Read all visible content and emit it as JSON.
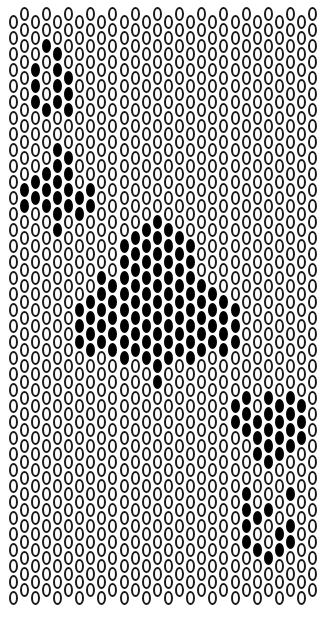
{
  "pattern": {
    "title": "Ace of Clubs peyote bead pattern",
    "colors": {
      "empty_fill": "#ffffff",
      "outline": "#1a1a1a",
      "filled": "#000000"
    },
    "grid": {
      "columns": 28,
      "rows": 37,
      "col_pitch": 11.1,
      "row_pitch": 16,
      "x0": 8.5,
      "even_col_top": 15,
      "odd_col_top": 7,
      "bottom_limit": 612
    },
    "filled_cells": {
      "top_left_A": [
        [
          2,
          3
        ],
        [
          2,
          4
        ],
        [
          2,
          5
        ],
        [
          3,
          2
        ],
        [
          3,
          6
        ],
        [
          4,
          2
        ],
        [
          4,
          3
        ],
        [
          4,
          4
        ],
        [
          4,
          5
        ],
        [
          5,
          4
        ],
        [
          5,
          5
        ],
        [
          5,
          6
        ]
      ],
      "top_left_club": [
        [
          1,
          11
        ],
        [
          1,
          12
        ],
        [
          2,
          10
        ],
        [
          2,
          11
        ],
        [
          3,
          10
        ],
        [
          3,
          11
        ],
        [
          3,
          12
        ],
        [
          4,
          8
        ],
        [
          4,
          9
        ],
        [
          4,
          10
        ],
        [
          4,
          11
        ],
        [
          4,
          12
        ],
        [
          4,
          13
        ],
        [
          5,
          9
        ],
        [
          5,
          10
        ],
        [
          5,
          11
        ],
        [
          5,
          12
        ],
        [
          6,
          11
        ],
        [
          6,
          12
        ],
        [
          7,
          11
        ],
        [
          7,
          12
        ]
      ],
      "center_club": [
        [
          6,
          18
        ],
        [
          6,
          19
        ],
        [
          6,
          20
        ],
        [
          7,
          18
        ],
        [
          7,
          19
        ],
        [
          7,
          20
        ],
        [
          7,
          21
        ],
        [
          8,
          16
        ],
        [
          8,
          17
        ],
        [
          8,
          18
        ],
        [
          8,
          19
        ],
        [
          8,
          20
        ],
        [
          9,
          17
        ],
        [
          9,
          18
        ],
        [
          9,
          19
        ],
        [
          9,
          20
        ],
        [
          9,
          21
        ],
        [
          10,
          14
        ],
        [
          10,
          15
        ],
        [
          10,
          16
        ],
        [
          10,
          17
        ],
        [
          10,
          18
        ],
        [
          10,
          19
        ],
        [
          10,
          20
        ],
        [
          10,
          21
        ],
        [
          11,
          14
        ],
        [
          11,
          15
        ],
        [
          11,
          16
        ],
        [
          11,
          17
        ],
        [
          11,
          18
        ],
        [
          11,
          19
        ],
        [
          11,
          20
        ],
        [
          11,
          21
        ],
        [
          12,
          13
        ],
        [
          12,
          14
        ],
        [
          12,
          15
        ],
        [
          12,
          16
        ],
        [
          12,
          17
        ],
        [
          12,
          18
        ],
        [
          12,
          19
        ],
        [
          12,
          20
        ],
        [
          12,
          21
        ],
        [
          13,
          13
        ],
        [
          13,
          14
        ],
        [
          13,
          15
        ],
        [
          13,
          16
        ],
        [
          13,
          17
        ],
        [
          13,
          18
        ],
        [
          13,
          19
        ],
        [
          13,
          20
        ],
        [
          13,
          21
        ],
        [
          13,
          22
        ],
        [
          13,
          23
        ],
        [
          14,
          13
        ],
        [
          14,
          14
        ],
        [
          14,
          15
        ],
        [
          14,
          16
        ],
        [
          14,
          17
        ],
        [
          14,
          18
        ],
        [
          14,
          19
        ],
        [
          14,
          20
        ],
        [
          14,
          21
        ],
        [
          15,
          14
        ],
        [
          15,
          15
        ],
        [
          15,
          16
        ],
        [
          15,
          17
        ],
        [
          15,
          18
        ],
        [
          15,
          19
        ],
        [
          15,
          20
        ],
        [
          15,
          21
        ],
        [
          16,
          14
        ],
        [
          16,
          15
        ],
        [
          16,
          16
        ],
        [
          16,
          17
        ],
        [
          16,
          18
        ],
        [
          16,
          19
        ],
        [
          16,
          20
        ],
        [
          16,
          21
        ],
        [
          17,
          17
        ],
        [
          17,
          18
        ],
        [
          17,
          19
        ],
        [
          17,
          20
        ],
        [
          17,
          21
        ],
        [
          18,
          17
        ],
        [
          18,
          18
        ],
        [
          18,
          19
        ],
        [
          18,
          20
        ],
        [
          19,
          18
        ],
        [
          19,
          19
        ],
        [
          19,
          20
        ],
        [
          19,
          21
        ],
        [
          20,
          18
        ],
        [
          20,
          19
        ],
        [
          20,
          20
        ]
      ],
      "bottom_right_club": [
        [
          20,
          24
        ],
        [
          20,
          25
        ],
        [
          21,
          24
        ],
        [
          21,
          25
        ],
        [
          21,
          26
        ],
        [
          22,
          25
        ],
        [
          22,
          26
        ],
        [
          22,
          27
        ],
        [
          23,
          24
        ],
        [
          23,
          25
        ],
        [
          23,
          26
        ],
        [
          23,
          27
        ],
        [
          23,
          28
        ],
        [
          24,
          24
        ],
        [
          24,
          25
        ],
        [
          24,
          26
        ],
        [
          24,
          27
        ],
        [
          25,
          24
        ],
        [
          25,
          25
        ],
        [
          25,
          26
        ],
        [
          25,
          27
        ],
        [
          26,
          24
        ],
        [
          26,
          25
        ],
        [
          26,
          26
        ]
      ],
      "bottom_right_A": [
        [
          21,
          30
        ],
        [
          21,
          31
        ],
        [
          21,
          32
        ],
        [
          21,
          33
        ],
        [
          22,
          31
        ],
        [
          22,
          33
        ],
        [
          23,
          31
        ],
        [
          23,
          34
        ],
        [
          24,
          32
        ],
        [
          24,
          33
        ],
        [
          25,
          30
        ],
        [
          25,
          32
        ],
        [
          25,
          33
        ]
      ]
    }
  }
}
